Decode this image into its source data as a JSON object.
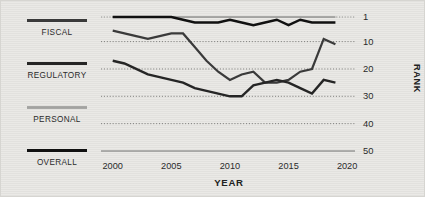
{
  "legend": {
    "entries": [
      {
        "label": "FISCAL",
        "color": "#3b3b3b"
      },
      {
        "label": "REGULATORY",
        "color": "#262626"
      },
      {
        "label": "PERSONAL",
        "color": "#a8a8a6"
      },
      {
        "label": "OVERALL",
        "color": "#111111"
      }
    ]
  },
  "chart_data": {
    "type": "line",
    "title": "",
    "xlabel": "YEAR",
    "ylabel": "RANK",
    "xlim": [
      1999,
      2020.5
    ],
    "ylim": [
      1,
      50
    ],
    "y_inverted": true,
    "grid": "horizontal-dotted",
    "legend_position": "left",
    "xticks": [
      "2000",
      "2005",
      "2010",
      "2015",
      "2020"
    ],
    "xtick_values": [
      2000,
      2005,
      2010,
      2015,
      2020
    ],
    "yticks": [
      "1",
      "10",
      "20",
      "30",
      "40",
      "50"
    ],
    "ytick_values": [
      1,
      10,
      20,
      30,
      40,
      50
    ],
    "x": [
      2000,
      2001,
      2002,
      2003,
      2004,
      2005,
      2006,
      2007,
      2008,
      2009,
      2010,
      2011,
      2012,
      2013,
      2014,
      2015,
      2016,
      2017,
      2018,
      2019
    ],
    "series": [
      {
        "name": "PERSONAL",
        "color": "#a8a8a6",
        "width": 2.2,
        "values": [
          1,
          1,
          1,
          1,
          1,
          1,
          1,
          1,
          1,
          1,
          1,
          1,
          1,
          1,
          1,
          1,
          1,
          1,
          1,
          1
        ]
      },
      {
        "name": "OVERALL",
        "color": "#111111",
        "width": 2.4,
        "values": [
          1,
          1,
          1,
          1,
          1,
          1,
          2,
          3,
          3,
          3,
          2,
          3,
          4,
          3,
          2,
          4,
          2,
          3,
          3,
          3
        ]
      },
      {
        "name": "FISCAL",
        "color": "#3b3b3b",
        "width": 2.2,
        "values": [
          6,
          7,
          8,
          9,
          8,
          7,
          7,
          12,
          17,
          21,
          24,
          22,
          21,
          25,
          25,
          24,
          21,
          20,
          9,
          11
        ]
      },
      {
        "name": "REGULATORY",
        "color": "#262626",
        "width": 2.4,
        "values": [
          17,
          18,
          20,
          22,
          23,
          24,
          25,
          27,
          28,
          29,
          30,
          30,
          26,
          25,
          24,
          25,
          27,
          29,
          24,
          25
        ]
      }
    ]
  }
}
